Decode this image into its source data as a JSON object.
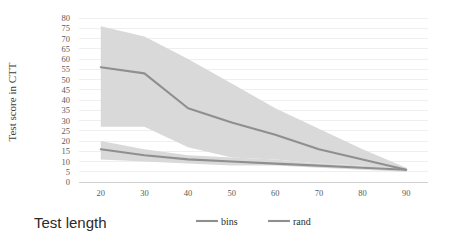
{
  "chart_data": {
    "type": "line",
    "title": "",
    "xlabel": "Test length",
    "ylabel": "Test score in CTT",
    "x": [
      20,
      30,
      40,
      50,
      60,
      70,
      80,
      90
    ],
    "xlim": [
      15,
      95
    ],
    "ylim": [
      0,
      80
    ],
    "ytick_step": 5,
    "yticks": [
      0,
      5,
      10,
      15,
      20,
      25,
      30,
      35,
      40,
      45,
      50,
      55,
      60,
      65,
      70,
      75,
      80
    ],
    "xticks": [
      20,
      30,
      40,
      50,
      60,
      70,
      80,
      90
    ],
    "grid": true,
    "legend_position": "bottom",
    "series": [
      {
        "name": "bins",
        "color": "#8f8f8f",
        "band_color": "#d9d9d9",
        "values": [
          56,
          53,
          36,
          29,
          23,
          16,
          11,
          6
        ],
        "band_upper": [
          76,
          71,
          60,
          48,
          36,
          26,
          16,
          7
        ],
        "band_lower": [
          27,
          27,
          17,
          12,
          11,
          9,
          8,
          5
        ]
      },
      {
        "name": "rand",
        "color": "#8f8f8f",
        "band_color": "#d9d9d9",
        "values": [
          16,
          13,
          11,
          10,
          9,
          8,
          7,
          6
        ],
        "band_upper": [
          20,
          16,
          13,
          12,
          11,
          9,
          8,
          7
        ],
        "band_lower": [
          11,
          10,
          9,
          8,
          8,
          7,
          6,
          5
        ]
      }
    ]
  },
  "legend": {
    "items": [
      {
        "label": "bins",
        "color": "#8f8f8f"
      },
      {
        "label": "rand",
        "color": "#8f8f8f"
      }
    ]
  },
  "axis": {
    "y_title": "Test score in CTT",
    "x_title": "Test length"
  }
}
